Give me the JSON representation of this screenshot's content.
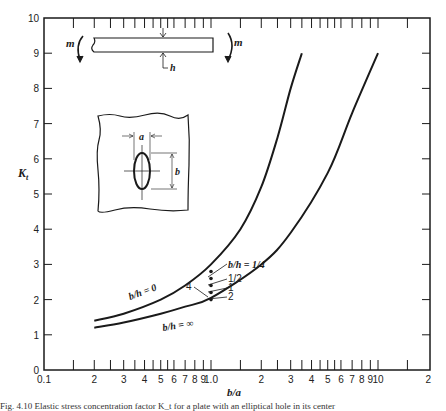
{
  "chart_data": {
    "type": "line",
    "title": "",
    "xlabel": "b/a",
    "ylabel": "K_t",
    "xscale": "log",
    "xlim": [
      0.1,
      20
    ],
    "ylim": [
      0,
      10
    ],
    "grid": false,
    "x_tick_labels": [
      "0.1",
      "2",
      "3",
      "4",
      "5",
      "6",
      "7",
      "8",
      "9",
      "1.0",
      "2",
      "3",
      "4",
      "5",
      "6",
      "7",
      "8",
      "9",
      "10",
      "2"
    ],
    "y_tick_labels": [
      "0",
      "1",
      "2",
      "3",
      "4",
      "5",
      "6",
      "7",
      "8",
      "9",
      "10"
    ],
    "series": [
      {
        "name": "b/h = 0",
        "x": [
          0.2,
          0.3,
          0.5,
          0.7,
          1.0,
          1.5,
          2.0,
          2.5,
          3.0,
          3.5
        ],
        "y": [
          1.4,
          1.6,
          2.0,
          2.4,
          3.0,
          4.0,
          5.2,
          6.6,
          8.0,
          9.0
        ]
      },
      {
        "name": "b/h = ∞",
        "x": [
          0.2,
          0.3,
          0.5,
          0.7,
          1.0,
          2.0,
          3.0,
          5.0,
          7.0,
          10.0
        ],
        "y": [
          1.2,
          1.35,
          1.6,
          1.8,
          2.05,
          3.0,
          3.9,
          5.6,
          7.3,
          9.0
        ]
      }
    ],
    "points": [
      {
        "label": "b/h = 1/4",
        "x": 1.0,
        "y": 2.8
      },
      {
        "label": "1/2",
        "x": 1.0,
        "y": 2.6
      },
      {
        "label": "1",
        "x": 1.0,
        "y": 2.4
      },
      {
        "label": "2",
        "x": 1.0,
        "y": 2.2
      },
      {
        "label": "4",
        "x": 1.0,
        "y": 2.0
      }
    ],
    "annotations": [
      "b/h = 0",
      "b/h = ∞",
      "b/h = 1/4",
      "1/2",
      "1",
      "2",
      "4",
      "m",
      "m",
      "h",
      "a",
      "b"
    ]
  },
  "labels": {
    "ylabel": "K",
    "ylabel_sub": "t",
    "xlabel": "b/a",
    "curve0": "b/h = 0",
    "curveInf": "b/h = ∞",
    "pt_quarter": "b/h = 1/4",
    "pt_half": "1/2",
    "pt_one": "1",
    "pt_two": "2",
    "pt_four": "4",
    "moment_left": "m",
    "moment_right": "m",
    "thickness": "h",
    "hole_width": "a",
    "hole_height": "b"
  },
  "caption": "Fig. 4.10  Elastic stress concentration factor K_t for a plate with an elliptical hole in its center"
}
